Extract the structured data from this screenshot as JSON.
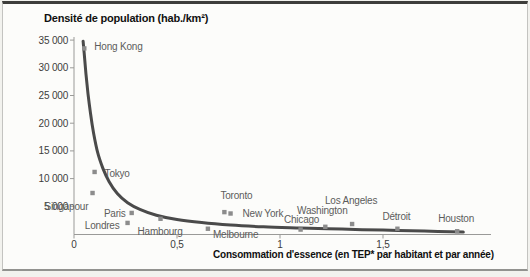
{
  "chart_data": {
    "type": "scatter",
    "title": "Densité de population (hab./km²)",
    "xlabel": "Consommation d'essence (en TEP* par habitant et par année)",
    "grid": false,
    "legend": "none",
    "xlim": [
      0,
      2.02
    ],
    "ylim": [
      0,
      35500
    ],
    "x_ticks": [
      {
        "value": 0,
        "label": "0"
      },
      {
        "value": 0.5,
        "label": "0,5"
      },
      {
        "value": 1,
        "label": "1"
      },
      {
        "value": 1.5,
        "label": "1,5"
      }
    ],
    "y_ticks": [
      {
        "value": 5000,
        "label": "5 000"
      },
      {
        "value": 10000,
        "label": "10 000"
      },
      {
        "value": 15000,
        "label": "15 000"
      },
      {
        "value": 20000,
        "label": "20 000"
      },
      {
        "value": 25000,
        "label": "25 000"
      },
      {
        "value": 30000,
        "label": "30 000"
      },
      {
        "value": 35000,
        "label": "35 000"
      }
    ],
    "points": [
      {
        "name": "Hong Kong",
        "x": 0.05,
        "y": 33500,
        "label": {
          "dx": 10,
          "dy": 2,
          "anchor": "start"
        }
      },
      {
        "name": "Tokyo",
        "x": 0.1,
        "y": 11200,
        "label": {
          "dx": 10,
          "dy": 5,
          "anchor": "start"
        }
      },
      {
        "name": "Singapour",
        "x": 0.09,
        "y": 7400,
        "label": {
          "dx": -48,
          "dy": 17,
          "anchor": "start"
        }
      },
      {
        "name": "Paris",
        "x": 0.28,
        "y": 3800,
        "label": {
          "dx": -6,
          "dy": 4,
          "anchor": "end"
        }
      },
      {
        "name": "Londres",
        "x": 0.26,
        "y": 2000,
        "label": {
          "dx": -8,
          "dy": 6,
          "anchor": "end"
        }
      },
      {
        "name": "Hambourg",
        "x": 0.42,
        "y": 2750,
        "label": {
          "dx": -23,
          "dy": 16,
          "anchor": "start"
        }
      },
      {
        "name": "Melbourne",
        "x": 0.65,
        "y": 950,
        "label": {
          "dx": 5,
          "dy": 9,
          "anchor": "start"
        }
      },
      {
        "name": "Toronto",
        "x": 0.73,
        "y": 3950,
        "label": {
          "dx": 12,
          "dy": -13,
          "anchor": "middle"
        }
      },
      {
        "name": "New York",
        "x": 0.76,
        "y": 3700,
        "label": {
          "dx": 12,
          "dy": 3,
          "anchor": "start"
        }
      },
      {
        "name": "Chicago",
        "x": 1.1,
        "y": 800,
        "label": {
          "dx": 1,
          "dy": -7,
          "anchor": "middle"
        }
      },
      {
        "name": "Washington",
        "x": 1.22,
        "y": 1300,
        "label": {
          "dx": -3,
          "dy": -13,
          "anchor": "middle"
        }
      },
      {
        "name": "Los Angeles",
        "x": 1.35,
        "y": 1800,
        "label": {
          "dx": -1,
          "dy": -20,
          "anchor": "middle"
        }
      },
      {
        "name": "Détroit",
        "x": 1.57,
        "y": 950,
        "label": {
          "dx": -1,
          "dy": -9,
          "anchor": "middle"
        }
      },
      {
        "name": "Houston",
        "x": 1.86,
        "y": 500,
        "label": {
          "dx": -1,
          "dy": -9,
          "anchor": "middle"
        }
      }
    ],
    "trend_curve": [
      [
        0.044,
        34800
      ],
      [
        0.05,
        32400
      ],
      [
        0.058,
        29000
      ],
      [
        0.068,
        25300
      ],
      [
        0.08,
        21800
      ],
      [
        0.095,
        18200
      ],
      [
        0.115,
        14700
      ],
      [
        0.14,
        11900
      ],
      [
        0.17,
        9500
      ],
      [
        0.21,
        7300
      ],
      [
        0.26,
        5650
      ],
      [
        0.32,
        4450
      ],
      [
        0.4,
        3400
      ],
      [
        0.5,
        2600
      ],
      [
        0.62,
        2050
      ],
      [
        0.76,
        1600
      ],
      [
        0.92,
        1300
      ],
      [
        1.1,
        1080
      ],
      [
        1.3,
        880
      ],
      [
        1.5,
        700
      ],
      [
        1.7,
        530
      ],
      [
        1.89,
        340
      ]
    ],
    "colors": {
      "curve": "#4a4a4a",
      "marker": "#8c8c8c",
      "axis": "#9a9a98",
      "tick_label": "#3c3c3c",
      "city_label": "#5c5c5c",
      "title": "#101010"
    }
  }
}
